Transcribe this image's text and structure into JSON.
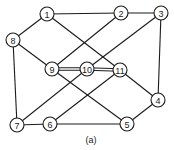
{
  "caption": "(a)",
  "colors": {
    "stroke": "#1a1a1a",
    "background": "#ffffff"
  },
  "node_radius": 7,
  "nodes": [
    {
      "id": "1",
      "x": 47,
      "y": 14
    },
    {
      "id": "2",
      "x": 121,
      "y": 13
    },
    {
      "id": "3",
      "x": 161,
      "y": 13
    },
    {
      "id": "4",
      "x": 158,
      "y": 100
    },
    {
      "id": "5",
      "x": 127,
      "y": 124
    },
    {
      "id": "6",
      "x": 50,
      "y": 124
    },
    {
      "id": "7",
      "x": 17,
      "y": 125
    },
    {
      "id": "8",
      "x": 13,
      "y": 40
    },
    {
      "id": "9",
      "x": 52,
      "y": 69
    },
    {
      "id": "10",
      "x": 87,
      "y": 69
    },
    {
      "id": "11",
      "x": 120,
      "y": 70
    }
  ],
  "edges": [
    {
      "from": "1",
      "to": "2"
    },
    {
      "from": "2",
      "to": "3"
    },
    {
      "from": "1",
      "to": "8"
    },
    {
      "from": "1",
      "to": "11"
    },
    {
      "from": "2",
      "to": "9"
    },
    {
      "from": "3",
      "to": "10"
    },
    {
      "from": "3",
      "to": "4"
    },
    {
      "from": "8",
      "to": "9"
    },
    {
      "from": "8",
      "to": "7"
    },
    {
      "from": "9",
      "to": "10",
      "double": true
    },
    {
      "from": "10",
      "to": "11",
      "double": true
    },
    {
      "from": "10",
      "to": "7"
    },
    {
      "from": "9",
      "to": "5"
    },
    {
      "from": "11",
      "to": "6"
    },
    {
      "from": "11",
      "to": "4"
    },
    {
      "from": "4",
      "to": "5"
    },
    {
      "from": "5",
      "to": "6"
    },
    {
      "from": "6",
      "to": "7"
    }
  ]
}
